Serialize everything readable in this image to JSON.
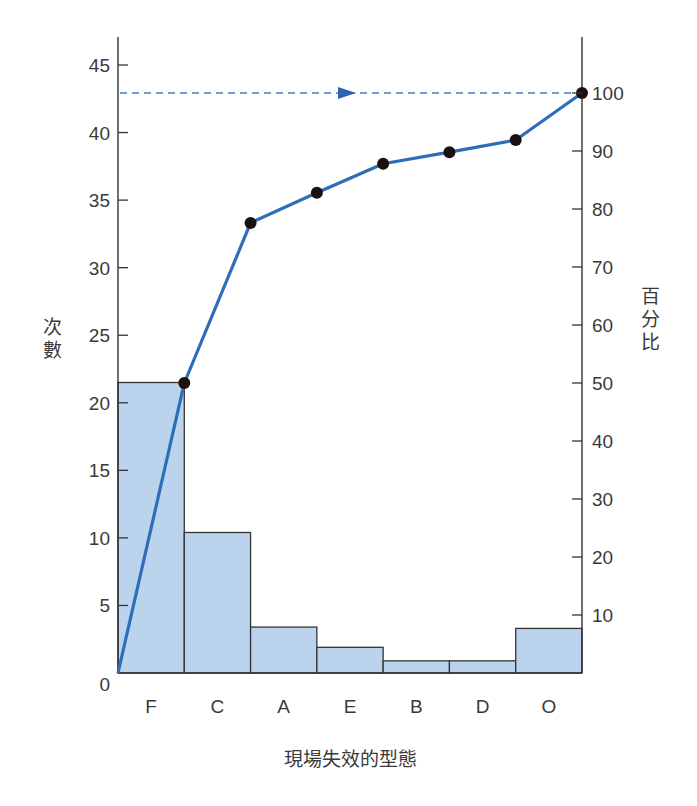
{
  "chart_data": {
    "type": "pareto",
    "title": "",
    "xlabel": "現場失效的型態",
    "ylabel": "次數",
    "ylabel_right": "百分比",
    "categories": [
      "F",
      "C",
      "A",
      "E",
      "B",
      "D",
      "O"
    ],
    "series": [
      {
        "name": "次數",
        "type": "bar",
        "axis": "left",
        "values": [
          21.5,
          10.4,
          3.4,
          1.9,
          0.9,
          0.9,
          3.3
        ]
      },
      {
        "name": "累積百分比",
        "type": "line",
        "axis": "right",
        "values": [
          50.0,
          77.6,
          82.8,
          87.8,
          89.8,
          91.9,
          100.0
        ]
      }
    ],
    "y_left": {
      "ylim": [
        0,
        45
      ],
      "ticks": [
        0,
        5,
        10,
        15,
        20,
        25,
        30,
        35,
        40,
        45
      ]
    },
    "y_right": {
      "ylim": [
        0,
        100
      ],
      "ticks": [
        10,
        20,
        30,
        40,
        50,
        60,
        70,
        80,
        90,
        100
      ]
    },
    "reference_line": {
      "value_percent": 100,
      "style": "dashed",
      "arrow": "right"
    },
    "grid": false,
    "legend": "none",
    "colors": {
      "bar_fill": "#bcd3ee",
      "bar_stroke": "#333333",
      "line": "#2e6db8",
      "marker": "#1a1010",
      "axis": "#333333",
      "dashed": "#4a7cc4"
    }
  },
  "labels": {
    "y_left_chars": [
      "次",
      "數"
    ],
    "y_right_chars": [
      "百",
      "分",
      "比"
    ],
    "x_title": "現場失效的型態"
  }
}
